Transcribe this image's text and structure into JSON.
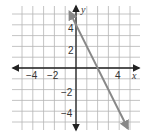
{
  "chart_data": {
    "type": "line",
    "title": "",
    "xlabel": "x",
    "ylabel": "y",
    "xlim": [
      -5.5,
      5.5
    ],
    "ylim": [
      -5.5,
      5.5
    ],
    "grid": true,
    "x_tick_labels": [
      "−4",
      "−2",
      "4"
    ],
    "y_tick_labels": [
      "4",
      "2",
      "−2",
      "−4"
    ],
    "series": [
      {
        "name": "line",
        "equation": "y = -2x + 4",
        "x": [
          -0.6,
          0,
          2,
          4.8
        ],
        "y": [
          5.2,
          4,
          0,
          -5.6
        ],
        "color": "#888888",
        "arrows": "both"
      }
    ]
  },
  "colors": {
    "grid": "#b5b5b5",
    "axis": "#222222",
    "line": "#888888"
  }
}
